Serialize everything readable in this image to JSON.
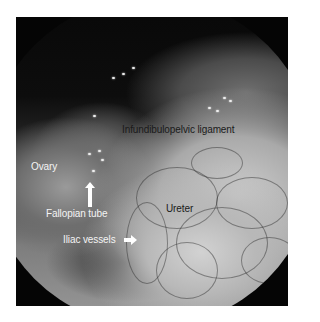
{
  "image": {
    "description": "Grayscale laparoscopic view of pelvic anatomy with annotation labels",
    "colors": {
      "background": "#ffffff",
      "frame": "#050505",
      "light_label": "#f4f4f4",
      "dark_label": "#1a1a1a"
    }
  },
  "labels": {
    "infundibulopelvic": "Infundibulopelvic ligament",
    "ovary": "Ovary",
    "fallopian_tube": "Fallopian tube",
    "ureter": "Ureter",
    "iliac_vessels": "Iliac vessels"
  },
  "arrows": {
    "fallopian_tube": "arrow-up",
    "iliac_vessels": "arrow-right"
  }
}
